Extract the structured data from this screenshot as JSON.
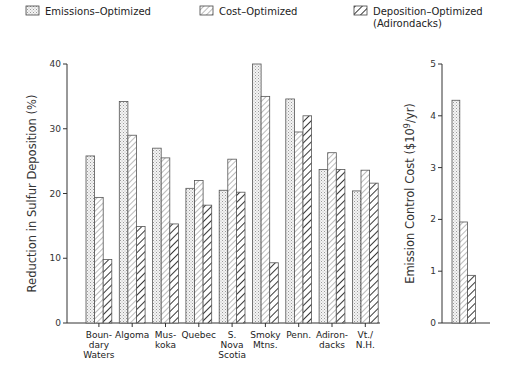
{
  "legend": [
    {
      "label": "Emissions–Optimized",
      "pattern": "dots"
    },
    {
      "label": "Cost–Optimized",
      "pattern": "thin-hatch"
    },
    {
      "label": "Deposition–Optimized",
      "label2": "(Adirondacks)",
      "pattern": "bold-hatch"
    }
  ],
  "chart_data": [
    {
      "type": "bar",
      "title": "",
      "ylabel": "Reduction in Sulfur Deposition (%)",
      "xlabel": "",
      "ylim": [
        0,
        40
      ],
      "yticks": [
        0,
        10,
        20,
        30,
        40
      ],
      "grid": false,
      "legend_position": "top",
      "categories": [
        "Boundary Waters",
        "Algoma",
        "Muskoka",
        "Quebec",
        "S. Nova Scotia",
        "Smoky Mtns.",
        "Penn.",
        "Adirondacks",
        "Vt./N.H."
      ],
      "category_label_lines": [
        [
          "Boun-",
          "dary",
          "Waters"
        ],
        [
          "Algoma"
        ],
        [
          "Mus-",
          "koka"
        ],
        [
          "Quebec"
        ],
        [
          "S.",
          "Nova",
          "Scotia"
        ],
        [
          "Smoky",
          "Mtns."
        ],
        [
          "Penn."
        ],
        [
          "Adiron-",
          "dacks"
        ],
        [
          "Vt./",
          "N.H."
        ]
      ],
      "series": [
        {
          "name": "Emissions–Optimized",
          "values": [
            25.8,
            34.2,
            27.0,
            20.8,
            20.5,
            40.0,
            34.6,
            23.7,
            20.4
          ]
        },
        {
          "name": "Cost–Optimized",
          "values": [
            19.4,
            29.0,
            25.5,
            22.0,
            25.3,
            35.0,
            29.5,
            26.3,
            23.6
          ]
        },
        {
          "name": "Deposition–Optimized (Adirondacks)",
          "values": [
            9.8,
            14.9,
            15.3,
            18.2,
            20.2,
            9.3,
            32.0,
            23.7,
            21.6
          ]
        }
      ]
    },
    {
      "type": "bar",
      "title": "",
      "ylabel": "Emission Control Cost ($10^9/yr)",
      "xlabel": "",
      "ylim": [
        0,
        5
      ],
      "yticks": [
        0,
        1,
        2,
        3,
        4,
        5
      ],
      "grid": false,
      "categories": [
        ""
      ],
      "series": [
        {
          "name": "Emissions–Optimized",
          "values": [
            4.3
          ]
        },
        {
          "name": "Cost–Optimized",
          "values": [
            1.95
          ]
        },
        {
          "name": "Deposition–Optimized (Adirondacks)",
          "values": [
            0.92
          ]
        }
      ]
    }
  ]
}
